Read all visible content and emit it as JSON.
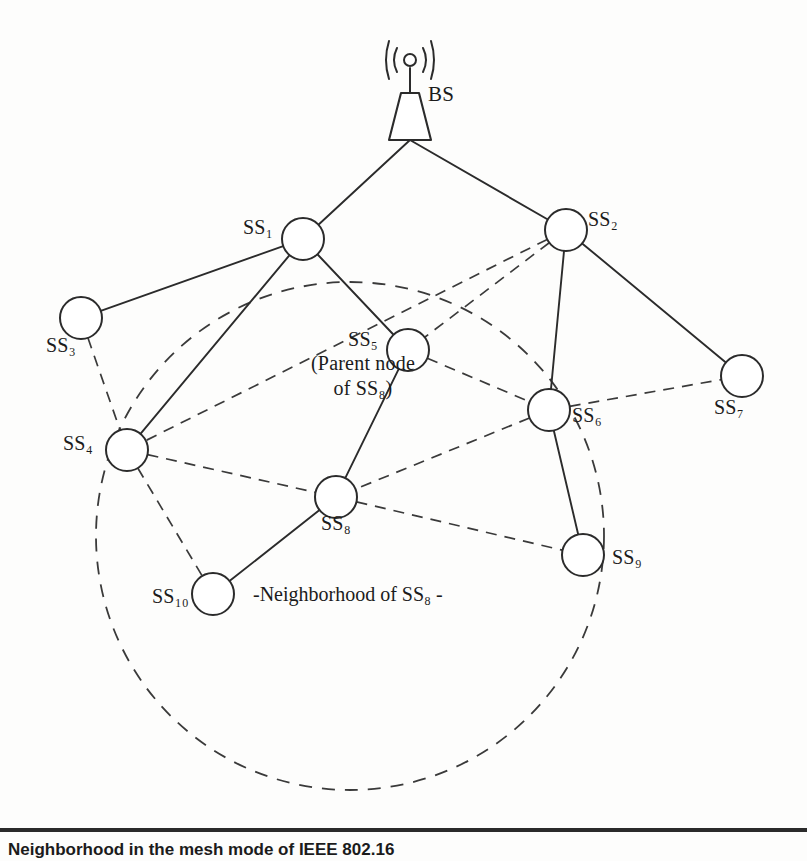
{
  "figure": {
    "title": "Neighborhood in the mesh mode of IEEE 802.16",
    "caption": "Neighborhood in the mesh mode of IEEE 802.16",
    "background_color": "#fdfdfc",
    "line_color": "#2b2b2b"
  },
  "base_station": {
    "id": "BS",
    "label": "BS",
    "x": 410,
    "y": 140,
    "label_x": 428,
    "label_y": 82
  },
  "nodes": [
    {
      "id": "SS1",
      "label": "SS",
      "sub": "1",
      "x": 303,
      "y": 239,
      "r": 21,
      "label_x": 243,
      "label_y": 216
    },
    {
      "id": "SS2",
      "label": "SS",
      "sub": "2",
      "x": 566,
      "y": 230,
      "r": 21,
      "label_x": 588,
      "label_y": 208
    },
    {
      "id": "SS3",
      "label": "SS",
      "sub": "3",
      "x": 81,
      "y": 318,
      "r": 21,
      "label_x": 46,
      "label_y": 334
    },
    {
      "id": "SS4",
      "label": "SS",
      "sub": "4",
      "x": 127,
      "y": 450,
      "r": 21,
      "label_x": 63,
      "label_y": 432
    },
    {
      "id": "SS5",
      "label": "SS",
      "sub": "5",
      "x": 408,
      "y": 350,
      "r": 21,
      "label_x": 268,
      "label_y": 327
    },
    {
      "id": "SS6",
      "label": "SS",
      "sub": "6",
      "x": 549,
      "y": 410,
      "r": 21,
      "label_x": 572,
      "label_y": 404
    },
    {
      "id": "SS7",
      "label": "SS",
      "sub": "7",
      "x": 742,
      "y": 376,
      "r": 21,
      "label_x": 714,
      "label_y": 396
    },
    {
      "id": "SS8",
      "label": "SS",
      "sub": "8",
      "x": 336,
      "y": 497,
      "r": 21,
      "label_x": 321,
      "label_y": 512
    },
    {
      "id": "SS9",
      "label": "SS",
      "sub": "9",
      "x": 583,
      "y": 555,
      "r": 21,
      "label_x": 612,
      "label_y": 546
    },
    {
      "id": "SS10",
      "label": "SS",
      "sub": "10",
      "x": 213,
      "y": 594,
      "r": 21,
      "label_x": 152,
      "label_y": 585
    }
  ],
  "node_labels": {
    "SS1": "SS₁",
    "SS2": "SS₂",
    "SS3": "SS₃",
    "SS4": "SS₄",
    "SS5": "SS₅",
    "SS5_note_line1": "SS₅",
    "SS5_note_line2": "(Parent node",
    "SS5_note_line3": "of SS₈)",
    "SS6": "SS₆",
    "SS7": "SS₇",
    "SS8": "SS₈",
    "SS9": "SS₉",
    "SS10": "SS₁₀"
  },
  "edges_solid": [
    {
      "from": "BS",
      "to": "SS1"
    },
    {
      "from": "BS",
      "to": "SS2"
    },
    {
      "from": "SS1",
      "to": "SS3"
    },
    {
      "from": "SS1",
      "to": "SS4"
    },
    {
      "from": "SS1",
      "to": "SS5"
    },
    {
      "from": "SS2",
      "to": "SS6"
    },
    {
      "from": "SS2",
      "to": "SS7"
    },
    {
      "from": "SS5",
      "to": "SS8"
    },
    {
      "from": "SS6",
      "to": "SS9"
    },
    {
      "from": "SS8",
      "to": "SS10"
    }
  ],
  "edges_dashed": [
    {
      "from": "SS3",
      "to": "SS4"
    },
    {
      "from": "SS2",
      "to": "SS5"
    },
    {
      "from": "SS2",
      "to": "SS4"
    },
    {
      "from": "SS5",
      "to": "SS6"
    },
    {
      "from": "SS4",
      "to": "SS8"
    },
    {
      "from": "SS4",
      "to": "SS10"
    },
    {
      "from": "SS6",
      "to": "SS7"
    },
    {
      "from": "SS6",
      "to": "SS8"
    },
    {
      "from": "SS8",
      "to": "SS9"
    }
  ],
  "neighborhood_region": {
    "label": "-Neighborhood of SS₈ -",
    "center_x": 350,
    "center_y": 536,
    "radius": 254,
    "label_x": 253,
    "label_y": 583,
    "style": "dashed"
  }
}
